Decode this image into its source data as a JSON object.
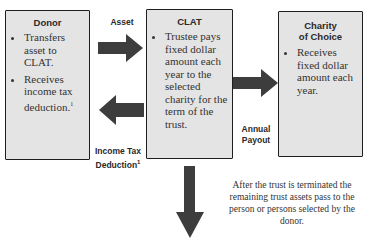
{
  "donor": {
    "title": "Donor",
    "bullets": [
      "Transfers asset to CLAT.",
      "Receives income tax deduction."
    ],
    "footnote_mark": "1"
  },
  "clat": {
    "title": "CLAT",
    "bullets": [
      "Trustee pays fixed dollar amount each year to the selected charity for the term of the trust."
    ]
  },
  "charity": {
    "title_line1": "Charity",
    "title_line2": "of Choice",
    "bullets": [
      "Receives fixed dollar amount each year."
    ]
  },
  "labels": {
    "asset": "Asset",
    "annual_line1": "Annual",
    "annual_line2": "Payout",
    "income_line1": "Income Tax",
    "income_line2": "Deduction",
    "income_footnote": "1"
  },
  "note": "After the trust is terminated the remaining trust assets pass to the person or persons selected by the donor.",
  "colors": {
    "box_fill": "#e4e4e4",
    "arrow_fill": "#3d3d3d",
    "border": "#1e1e1e"
  }
}
